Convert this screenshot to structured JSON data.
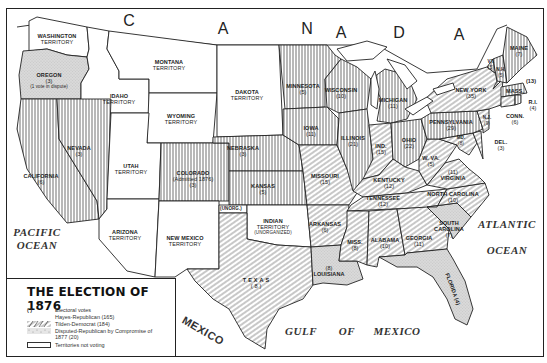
{
  "map": {
    "title": "THE ELECTION OF 1876",
    "country_label_letters": [
      "C",
      "A",
      "N",
      "A",
      "D",
      "A"
    ],
    "oceans": [
      {
        "id": "pacific",
        "label": "PACIFIC\nOCEAN",
        "line1": "PACIFIC",
        "line2": "OCEAN"
      },
      {
        "id": "atlantic",
        "label": "ATLANTIC\nOCEAN",
        "line1": "ATLANTIC",
        "line2": "OCEAN"
      },
      {
        "id": "gulf",
        "words": [
          "GULF",
          "OF",
          "MEXICO"
        ]
      },
      {
        "id": "mexico",
        "label": "MEXICO"
      }
    ],
    "lakes": [
      "L. Superior",
      "L. Michigan",
      "L. Huron",
      "L. Erie",
      "Ontario"
    ],
    "colors": {
      "ink": "#222222",
      "paper": "#ffffff",
      "disputed_fill": "#d9d9d9"
    }
  },
  "legend": {
    "title": "THE ELECTION OF 1876",
    "items": [
      {
        "symbol": "( )",
        "label": "Electoral votes"
      },
      {
        "symbol": "vertical-lines",
        "label": "Hayes-Republican (165)"
      },
      {
        "symbol": "diagonal-lines",
        "label": "Tilden-Democrat (184)"
      },
      {
        "symbol": "stipple",
        "label": "Disputed-Republican by Compromise of 1877 (20)"
      },
      {
        "symbol": "empty-box",
        "label": "Territories not voting"
      }
    ],
    "totals": {
      "hayes_republican": 165,
      "tilden_democrat": 184,
      "disputed": 20
    }
  },
  "regions": {
    "washington": {
      "name": "WASHINGTON",
      "sub": "TERRITORY",
      "status": "territory"
    },
    "oregon": {
      "name": "OREGON",
      "votes": "(3)",
      "note": "(1 vote in dispute)",
      "status": "disputed"
    },
    "california": {
      "name": "CALIFORNIA",
      "votes": "(6)",
      "status": "republican"
    },
    "nevada": {
      "name": "NEVADA",
      "votes": "(3)",
      "status": "republican"
    },
    "idaho": {
      "name": "IDAHO",
      "sub": "TERRITORY",
      "status": "territory"
    },
    "montana": {
      "name": "MONTANA",
      "sub": "TERRITORY",
      "status": "territory"
    },
    "wyoming": {
      "name": "WYOMING",
      "sub": "TERRITORY",
      "status": "territory"
    },
    "utah": {
      "name": "UTAH",
      "sub": "TERRITORY",
      "status": "territory"
    },
    "arizona": {
      "name": "ARIZONA",
      "sub": "TERRITORY",
      "status": "territory"
    },
    "newmexico": {
      "name": "NEW MEXICO",
      "sub": "TERRITORY",
      "status": "territory"
    },
    "colorado": {
      "name": "COLORADO",
      "note": "(Admitted 1876)",
      "votes": "(3)",
      "status": "republican"
    },
    "dakota": {
      "name": "DAKOTA",
      "sub": "TERRITORY",
      "status": "territory"
    },
    "nebraska": {
      "name": "NEBRASKA",
      "votes": "(3)",
      "status": "republican"
    },
    "kansas": {
      "name": "KANSAS",
      "votes": "(5)",
      "status": "republican"
    },
    "unorg": {
      "name": "(UNORG.)",
      "status": "territory"
    },
    "indian": {
      "name": "INDIAN",
      "sub": "TERRITORY",
      "note": "(UNORGANIZED)",
      "status": "territory"
    },
    "texas": {
      "name": "TEXAS",
      "votes": "(8)",
      "status": "democrat"
    },
    "minnesota": {
      "name": "MINNESOTA",
      "votes": "(5)",
      "status": "republican"
    },
    "iowa": {
      "name": "IOWA",
      "votes": "(11)",
      "status": "republican"
    },
    "missouri": {
      "name": "MISSOURI",
      "votes": "(15)",
      "status": "democrat"
    },
    "arkansas": {
      "name": "ARKANSAS",
      "votes": "(6)",
      "status": "democrat"
    },
    "louisiana": {
      "name": "LOUISIANA",
      "votes": "(8)",
      "status": "disputed"
    },
    "wisconsin": {
      "name": "WISCONSIN",
      "votes": "(10)",
      "status": "republican"
    },
    "illinois": {
      "name": "ILLINOIS",
      "votes": "(21)",
      "status": "republican"
    },
    "michigan": {
      "name": "MICHIGAN",
      "votes": "(11)",
      "status": "republican"
    },
    "indiana": {
      "name": "IND.",
      "votes": "(15)",
      "status": "democrat"
    },
    "ohio": {
      "name": "OHIO",
      "votes": "(22)",
      "status": "republican"
    },
    "kentucky": {
      "name": "KENTUCKY",
      "votes": "(12)",
      "status": "democrat"
    },
    "tennessee": {
      "name": "TENNESSEE",
      "votes": "(12)",
      "status": "democrat"
    },
    "mississippi": {
      "name": "MISS.",
      "votes": "(8)",
      "status": "democrat"
    },
    "alabama": {
      "name": "ALABAMA",
      "votes": "(10)",
      "status": "democrat"
    },
    "georgia": {
      "name": "GEORGIA",
      "votes": "(11)",
      "status": "democrat"
    },
    "florida": {
      "name": "FLORIDA",
      "votes": "(4)",
      "status": "disputed"
    },
    "southcarolina": {
      "name": "SOUTH CAROLINA",
      "votes": "(7)",
      "status": "disputed"
    },
    "northcarolina": {
      "name": "NORTH CAROLINA",
      "votes": "(10)",
      "status": "democrat"
    },
    "virginia": {
      "name": "VIRGINIA",
      "votes": "(11)",
      "status": "democrat"
    },
    "westvirginia": {
      "name": "W. VA.",
      "votes": "(5)",
      "status": "democrat"
    },
    "maryland": {
      "name": "MD.",
      "votes": "(8)",
      "status": "democrat"
    },
    "delaware": {
      "name": "DEL.",
      "votes": "(3)",
      "status": "democrat"
    },
    "pennsylvania": {
      "name": "PENNSYLVANIA",
      "votes": "(29)",
      "status": "republican"
    },
    "newjersey": {
      "name": "N.J.",
      "votes": "(9)",
      "status": "democrat"
    },
    "newyork": {
      "name": "NEW YORK",
      "votes": "(35)",
      "status": "democrat"
    },
    "connecticut": {
      "name": "CONN.",
      "votes": "(6)",
      "status": "democrat"
    },
    "rhodeisland": {
      "name": "R.I.",
      "votes": "(4)",
      "status": "republican"
    },
    "massachusetts": {
      "name": "MASS.",
      "votes": "(13)",
      "status": "republican"
    },
    "vermont": {
      "name": "VT.",
      "votes": "(5)",
      "status": "republican"
    },
    "newhampshire": {
      "name": "N.H.",
      "votes": "(5)",
      "status": "republican"
    },
    "maine": {
      "name": "MAINE",
      "votes": "(7)",
      "status": "republican"
    }
  }
}
